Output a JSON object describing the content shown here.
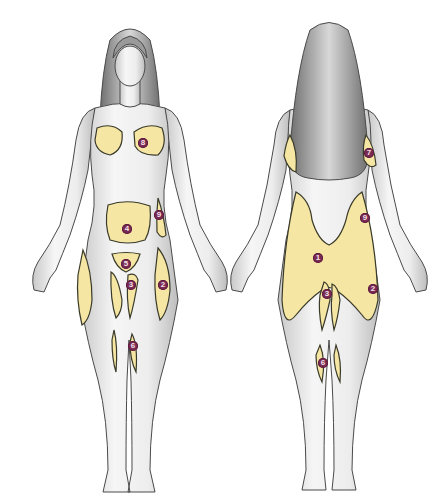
{
  "title": "",
  "colors": {
    "zone_fill": "#f5e6a3",
    "zone_stroke": "#3a3a2a",
    "marker": "#7a2a52",
    "skin": "#f2f2f2",
    "skin_shade": "#b9b9b9",
    "hair": "#8a8a8a",
    "outline": "#4a4a4a"
  },
  "front_figure": {
    "label": "front view",
    "markers": [
      {
        "n": "8",
        "x": 143,
        "y": 143,
        "zone": "breast"
      },
      {
        "n": "4",
        "x": 127,
        "y": 229,
        "zone": "abdomen"
      },
      {
        "n": "9",
        "x": 159,
        "y": 215,
        "zone": "flank"
      },
      {
        "n": "5",
        "x": 126,
        "y": 264,
        "zone": "pubic"
      },
      {
        "n": "3",
        "x": 131,
        "y": 285,
        "zone": "inner-thigh"
      },
      {
        "n": "2",
        "x": 163,
        "y": 285,
        "zone": "outer-thigh"
      },
      {
        "n": "6",
        "x": 133,
        "y": 346,
        "zone": "inner-knee"
      }
    ]
  },
  "back_figure": {
    "label": "back view",
    "markers": [
      {
        "n": "7",
        "x": 369,
        "y": 153,
        "zone": "upper-arm"
      },
      {
        "n": "9",
        "x": 365,
        "y": 218,
        "zone": "flank"
      },
      {
        "n": "1",
        "x": 318,
        "y": 258,
        "zone": "buttocks"
      },
      {
        "n": "3",
        "x": 327,
        "y": 294,
        "zone": "inner-thigh"
      },
      {
        "n": "2",
        "x": 373,
        "y": 289,
        "zone": "outer-thigh"
      },
      {
        "n": "6",
        "x": 323,
        "y": 363,
        "zone": "inner-knee"
      }
    ]
  }
}
